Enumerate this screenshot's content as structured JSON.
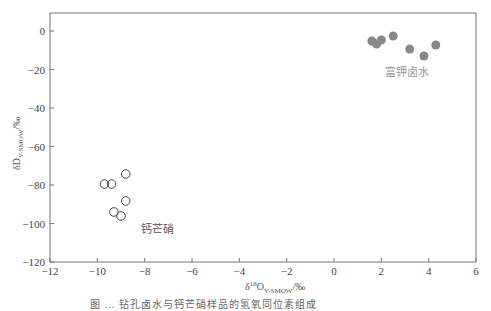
{
  "chart_data": {
    "type": "scatter",
    "title": "",
    "xlabel": "δ18O V-SMOW/‰",
    "ylabel": "δD V-SMOW/‰",
    "xlim": [
      -12,
      6
    ],
    "ylim": [
      -120,
      10
    ],
    "x_ticks": [
      "-12",
      "-10",
      "-8",
      "-6",
      "-4",
      "-2",
      "0",
      "2",
      "4",
      "6"
    ],
    "y_ticks": [
      "0",
      "-20",
      "-40",
      "-60",
      "-80",
      "-100",
      "-120"
    ],
    "grid": false,
    "legend": "none",
    "series": [
      {
        "name": "富钾卤水",
        "marker": "filled-circle",
        "color": "#888888",
        "points": [
          [
            1.6,
            -5.2
          ],
          [
            1.8,
            -6.8
          ],
          [
            2.0,
            -4.7
          ],
          [
            2.5,
            -2.6
          ],
          [
            3.2,
            -9.4
          ],
          [
            3.8,
            -13.0
          ],
          [
            4.3,
            -7.3
          ]
        ]
      },
      {
        "name": "钙芒硝",
        "marker": "open-circle",
        "color": "#444444",
        "points": [
          [
            -8.8,
            -74.3
          ],
          [
            -9.7,
            -79.5
          ],
          [
            -9.4,
            -79.5
          ],
          [
            -8.8,
            -88.3
          ],
          [
            -9.3,
            -94.0
          ],
          [
            -9.0,
            -96.1
          ]
        ]
      }
    ],
    "annotations": [
      {
        "text": "富钾卤水",
        "x": 2.6,
        "y": -22
      },
      {
        "text": "钙芒硝",
        "x": -7.8,
        "y": -96
      }
    ]
  },
  "labels": {
    "xlabel_main": "δ",
    "xlabel_sup": "18",
    "xlabel_o": "O",
    "xlabel_sub": "V-SMOW",
    "xlabel_unit": "/‰",
    "ylabel_main": "δD",
    "ylabel_sub": "V-SMOW",
    "ylabel_unit": "/‰",
    "anno_brine": "富钾卤水",
    "anno_glauberite": "钙芒硝"
  },
  "caption": "图 … 钻孔卤水与钙芒硝样品的氢氧同位素组成"
}
